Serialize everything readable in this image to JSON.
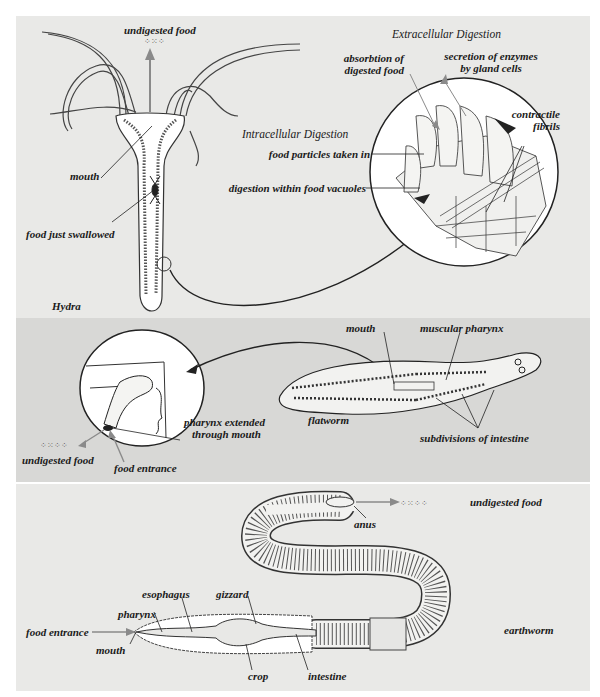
{
  "figure": {
    "hydra_panel": {
      "organism": "Hydra",
      "labels": {
        "undigested_food": "undigested food",
        "mouth": "mouth",
        "food_just_swallowed": "food just swallowed"
      },
      "extracellular": {
        "heading": "Extracellular Digestion",
        "absorbtion_1": "absorbtion of",
        "absorbtion_2": "digested food",
        "secretion_1": "secretion of enzymes",
        "secretion_2": "by gland cells",
        "contractile_1": "contractile",
        "contractile_2": "fibrils"
      },
      "intracellular": {
        "heading": "Intracellular  Digestion",
        "food_particles": "food particles taken in",
        "digestion_vacuoles": "digestion within food vacuoles"
      }
    },
    "flatworm_panel": {
      "organism": "flatworm",
      "labels": {
        "mouth": "mouth",
        "muscular_pharynx": "muscular pharynx",
        "subdivisions": "subdivisions of intestine",
        "pharynx_extended_1": "pharynx extended",
        "pharynx_extended_2": "through mouth",
        "undigested_food": "undigested food",
        "food_entrance": "food entrance"
      }
    },
    "earthworm_panel": {
      "organism": "earthworm",
      "labels": {
        "anus": "anus",
        "undigested_food": "undigested food",
        "esophagus": "esophagus",
        "gizzard": "gizzard",
        "pharynx": "pharynx",
        "food_entrance": "food entrance",
        "mouth": "mouth",
        "crop": "crop",
        "intestine": "intestine"
      }
    },
    "colors": {
      "panel_light": "#e9e9e7",
      "panel_dark": "#d8d8d6",
      "line": "#1a1a1a",
      "arrow_gray": "#8a8a8a"
    }
  }
}
